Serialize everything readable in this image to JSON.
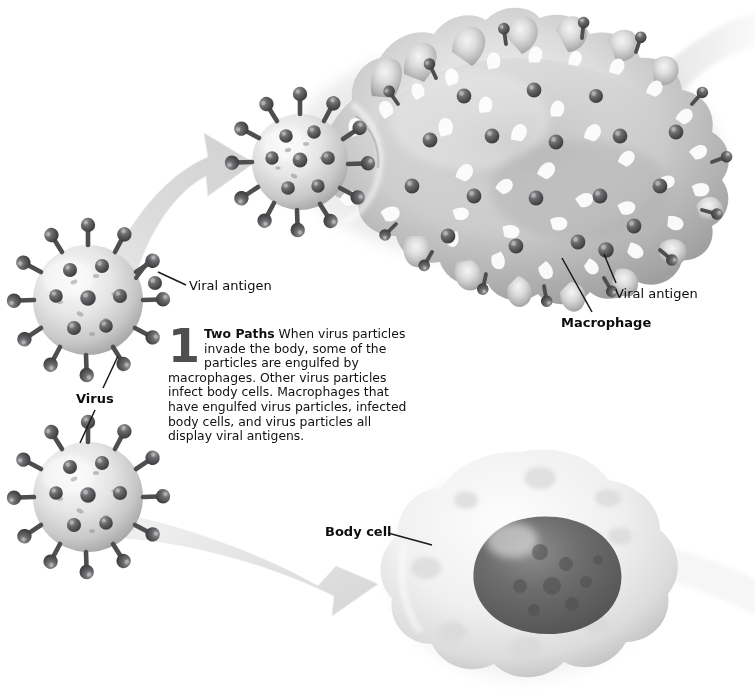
{
  "figure": {
    "background_color": "#ffffff",
    "width": 755,
    "height": 690
  },
  "caption": {
    "number": "1",
    "heading": "Two Paths",
    "text": "When virus particles invade the body, some of the particles are engulfed by macrophages. Other virus particles infect body cells. Macrophages that have engulfed virus particles, infected body cells, and virus particles all display viral antigens.",
    "number_color": "#4f4f4f",
    "text_color": "#111111"
  },
  "labels": {
    "viral_antigen_left": "Viral antigen",
    "viral_antigen_right": "Viral antigen",
    "macrophage": "Macrophage",
    "virus": "Virus",
    "body_cell": "Body cell"
  },
  "palette": {
    "cell_light": "#f2f2f2",
    "cell_mid": "#c9c9c9",
    "cell_shadow": "#9d9d9d",
    "antigen_knob": "#59595b",
    "antigen_knob_dark": "#3e3e40",
    "nucleus_dark": "#5e5e5e",
    "arrow_gray": "#d7d7d7",
    "leader_line": "#1a1a1a"
  },
  "elements": {
    "virus_top": {
      "name": "virus-particle-top",
      "description": "Spherical virus particle with surface spike proteins",
      "center": [
        88,
        300
      ],
      "radius": 55,
      "spike_count": 22
    },
    "virus_bottom": {
      "name": "virus-particle-bottom",
      "description": "Spherical virus particle with surface spike proteins",
      "center": [
        88,
        497
      ],
      "radius": 55,
      "spike_count": 22
    },
    "macrophage": {
      "name": "macrophage",
      "description": "Large lobed phagocyte with ruffled membrane engulfing a virus particle at its left end; surface studded with viral antigens",
      "center": [
        500,
        135
      ],
      "antigen_count": 30
    },
    "engulfed_virus": {
      "name": "engulfed-virus-particle",
      "description": "Virus particle being engulfed at the left lobe of the macrophage",
      "center": [
        300,
        162
      ],
      "radius": 48
    },
    "body_cell": {
      "name": "body-cell",
      "description": "Infected body cell with large dark nucleus",
      "center": [
        520,
        565
      ],
      "nucleus_center": [
        530,
        565
      ]
    },
    "arrow_upper": {
      "name": "arrow-to-macrophage",
      "description": "Thick curved gray arrow from top virus particle up-right to macrophage"
    },
    "arrow_lower": {
      "name": "arrow-to-body-cell",
      "description": "Thick curved gray arrow from bottom virus particle down-right to body cell"
    },
    "exit_band_top": {
      "name": "exit-band-macrophage",
      "description": "Pale band leaving the macrophage toward upper right edge"
    },
    "exit_band_bottom": {
      "name": "exit-band-body-cell",
      "description": "Pale band leaving the body cell toward the right edge"
    }
  }
}
